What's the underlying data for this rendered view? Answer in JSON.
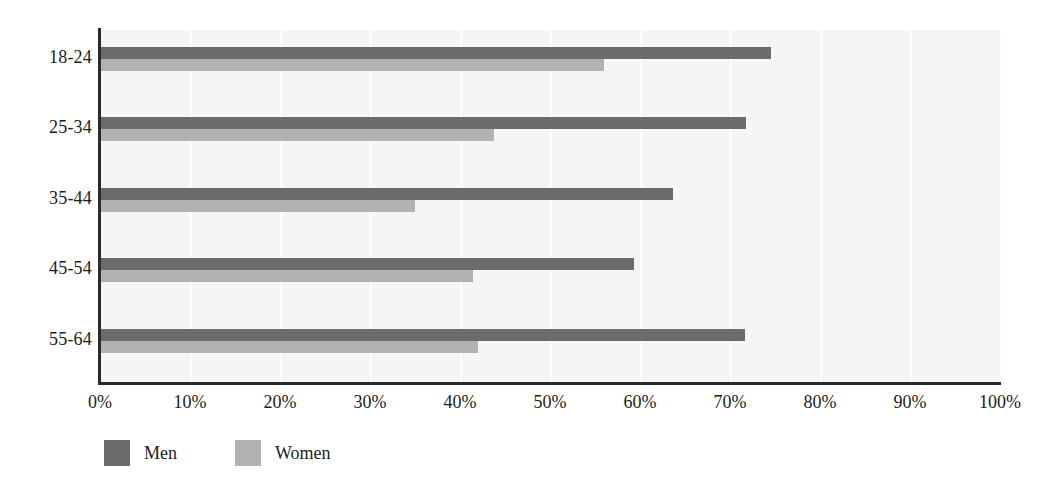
{
  "chart_data": {
    "type": "bar",
    "orientation": "horizontal",
    "title": "",
    "subtitle": "",
    "xlabel": "",
    "ylabel": "",
    "categories": [
      "18-24",
      "25-34",
      "35-44",
      "45-54",
      "55-64"
    ],
    "series": [
      {
        "name": "Men",
        "color": "#6b6b6b",
        "values": [
          74.5,
          71.8,
          63.7,
          59.3,
          71.7
        ]
      },
      {
        "name": "Women",
        "color": "#b2b2b2",
        "values": [
          56.0,
          43.8,
          35.0,
          41.4,
          42.0
        ]
      }
    ],
    "xlim": [
      0,
      100
    ],
    "xticks": [
      0,
      10,
      20,
      30,
      40,
      50,
      60,
      70,
      80,
      90,
      100
    ],
    "xtick_labels": [
      "0%",
      "10%",
      "20%",
      "30%",
      "40%",
      "50%",
      "60%",
      "70%",
      "80%",
      "90%",
      "100%"
    ],
    "grid": true,
    "grid_axis": "x",
    "legend_position": "bottom-left",
    "plot_background": "#f5f5f5",
    "gridline_color": "#fdfdfd",
    "axis_color": "#2a2a2a",
    "text_color": "#1c1c1c"
  },
  "legend": {
    "items": [
      {
        "label": "Men",
        "color": "#6b6b6b"
      },
      {
        "label": "Women",
        "color": "#b2b2b2"
      }
    ]
  }
}
